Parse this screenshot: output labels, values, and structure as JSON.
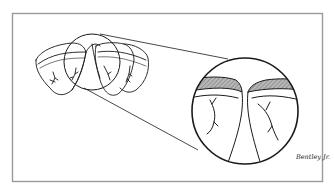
{
  "figure": {
    "type": "medical illustration",
    "frame_color": "#9a9a9a",
    "line_color": "#1a1a1a",
    "hatch_color": "#8c8c8c",
    "signature": "Bentley Jr.",
    "overview": {
      "label": "overview-structure",
      "lobes": 4
    },
    "magnifier": {
      "label": "magnified-detail"
    }
  }
}
